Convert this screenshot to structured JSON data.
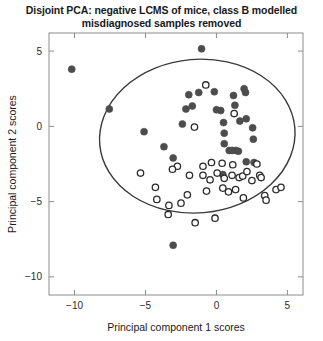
{
  "chart_data": {
    "type": "scatter",
    "title": "Disjoint PCA: negative LCMS of mice, class B modelled misdiagnosed samples removed",
    "title_line1": "Disjoint PCA: negative LCMS of mice, class B modelled",
    "title_line2": "misdiagnosed samples removed",
    "xlabel": "Principal component 1 scores",
    "ylabel": "Principal component 2 scores",
    "xlim": [
      -11.8,
      6.1
    ],
    "ylim": [
      -11.2,
      6.2
    ],
    "xticks": [
      -10,
      -5,
      0,
      5
    ],
    "xtick_labels": [
      "−10",
      "−5",
      "0",
      "5"
    ],
    "yticks": [
      5,
      0,
      -5,
      -10
    ],
    "ytick_labels": [
      "5",
      "0",
      "−5",
      "−10"
    ],
    "grid": false,
    "legend": null,
    "marker_colors": {
      "filled": "#4d4d4d",
      "open_edge": "#2b2b2b",
      "open_fill": "#ffffff",
      "ellipse": "#3a3a3a",
      "axis": "#8c8c8c"
    },
    "annotations": [
      {
        "kind": "confidence-ellipse",
        "center_x": -1.35,
        "center_y": -0.65,
        "semi_major": 6.9,
        "semi_minor": 5.1,
        "rotation_deg": -5
      }
    ],
    "series": [
      {
        "name": "filled markers",
        "marker": "filled-circle",
        "color": "#4d4d4d",
        "points": [
          [
            -10.2,
            3.8
          ],
          [
            -7.55,
            1.15
          ],
          [
            -5.1,
            -0.35
          ],
          [
            -3.7,
            -1.35
          ],
          [
            -3.05,
            -2.1
          ],
          [
            -3.05,
            -7.9
          ],
          [
            -2.4,
            0.15
          ],
          [
            -1.05,
            5.15
          ],
          [
            -0.15,
            2.3
          ],
          [
            0.0,
            1.1
          ],
          [
            0.3,
            1.05
          ],
          [
            0.5,
            0.25
          ],
          [
            0.55,
            -0.45
          ],
          [
            0.55,
            -1.15
          ],
          [
            0.9,
            -1.6
          ],
          [
            1.1,
            -1.6
          ],
          [
            1.2,
            2.05
          ],
          [
            1.3,
            1.4
          ],
          [
            1.35,
            -1.6
          ],
          [
            1.55,
            -1.65
          ],
          [
            1.65,
            0.35
          ],
          [
            1.95,
            2.5
          ],
          [
            2.05,
            2.25
          ],
          [
            2.1,
            0.5
          ],
          [
            2.1,
            -2.35
          ],
          [
            2.55,
            -0.1
          ],
          [
            2.6,
            -0.85
          ],
          [
            2.65,
            -2.4
          ],
          [
            0.45,
            -3.2
          ],
          [
            -1.25,
            2.25
          ],
          [
            -1.7,
            1.35
          ],
          [
            -1.95,
            2.1
          ],
          [
            -2.15,
            1.15
          ]
        ]
      },
      {
        "name": "open markers",
        "marker": "open-circle",
        "color": "#2b2b2b",
        "points": [
          [
            -0.75,
            2.75
          ],
          [
            1.25,
            0.85
          ],
          [
            -1.55,
            -0.05
          ],
          [
            -2.75,
            -2.65
          ],
          [
            -1.9,
            -3.25
          ],
          [
            -0.95,
            -2.65
          ],
          [
            -0.95,
            -3.25
          ],
          [
            -2.05,
            -4.55
          ],
          [
            -0.7,
            -4.3
          ],
          [
            -0.35,
            -2.4
          ],
          [
            -0.45,
            -3.55
          ],
          [
            0.05,
            -3.1
          ],
          [
            0.4,
            -2.45
          ],
          [
            0.55,
            -3.45
          ],
          [
            0.45,
            -4.1
          ],
          [
            0.85,
            -4.35
          ],
          [
            1.1,
            -3.25
          ],
          [
            1.15,
            -2.55
          ],
          [
            1.35,
            -4.2
          ],
          [
            1.6,
            -3.4
          ],
          [
            1.85,
            -3.3
          ],
          [
            1.9,
            -4.75
          ],
          [
            2.15,
            -3.0
          ],
          [
            2.5,
            -3.6
          ],
          [
            2.85,
            -2.5
          ],
          [
            3.05,
            -3.25
          ],
          [
            3.15,
            -3.4
          ],
          [
            3.4,
            -4.6
          ],
          [
            3.5,
            -4.9
          ],
          [
            -0.1,
            -6.1
          ],
          [
            -5.35,
            -3.1
          ],
          [
            -4.3,
            -4.05
          ],
          [
            -4.2,
            -4.85
          ],
          [
            -3.35,
            -5.25
          ],
          [
            -3.4,
            -5.85
          ],
          [
            -1.5,
            -6.4
          ],
          [
            -2.5,
            -5.1
          ],
          [
            4.2,
            -4.2
          ],
          [
            4.55,
            -4.05
          ],
          [
            -3.1,
            -2.85
          ]
        ]
      }
    ]
  }
}
